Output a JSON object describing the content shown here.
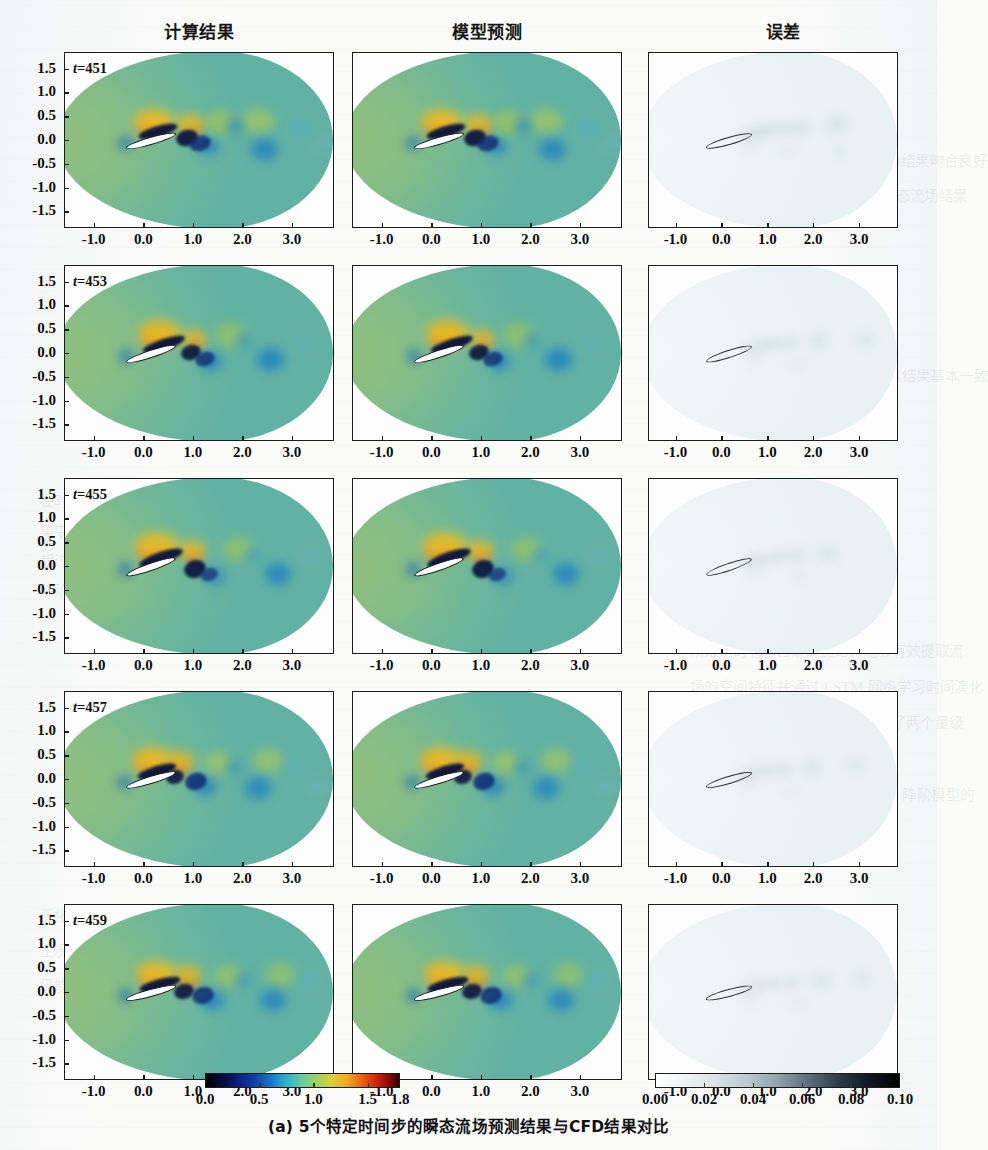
{
  "figure": {
    "caption": "(a) 5个特定时间步的瞬态流场预测结果与CFD结果对比",
    "columns": [
      {
        "key": "cfd",
        "label": "计算结果"
      },
      {
        "key": "model",
        "label": "模型预测"
      },
      {
        "key": "error",
        "label": "误差"
      }
    ],
    "rows": [
      {
        "time_label": "t=451",
        "t": 451
      },
      {
        "time_label": "t=453",
        "t": 453
      },
      {
        "time_label": "t=455",
        "t": 455
      },
      {
        "time_label": "t=457",
        "t": 457
      },
      {
        "time_label": "t=459",
        "t": 459
      }
    ]
  },
  "axes": {
    "x_ticks": [
      "-1.0",
      "0.0",
      "1.0",
      "2.0",
      "3.0"
    ],
    "x_values": [
      -1.0,
      0.0,
      1.0,
      2.0,
      3.0
    ],
    "y_ticks": [
      "1.5",
      "1.0",
      "0.5",
      "0.0",
      "-0.5",
      "-1.0",
      "-1.5"
    ],
    "y_values": [
      1.5,
      1.0,
      0.5,
      0.0,
      -0.5,
      -1.0,
      -1.5
    ],
    "xlim": [
      -1.6,
      3.85
    ],
    "ylim": [
      -1.85,
      1.85
    ]
  },
  "colorbars": {
    "field": {
      "ticks": [
        "0.0",
        "0.5",
        "1.0",
        "1.5",
        "1.8"
      ],
      "values": [
        0.0,
        0.5,
        1.0,
        1.5,
        1.8
      ],
      "range": [
        0.0,
        1.8
      ],
      "colors": [
        "#000000",
        "#0a1a6e",
        "#1878c8",
        "#2fb3cf",
        "#9ad25f",
        "#d7d13a",
        "#f2aa20",
        "#d0260d",
        "#2a0202"
      ]
    },
    "error": {
      "ticks": [
        "0.00",
        "0.02",
        "0.04",
        "0.06",
        "0.08",
        "0.10"
      ],
      "values": [
        0.0,
        0.02,
        0.04,
        0.06,
        0.08,
        0.1
      ],
      "range": [
        0.0,
        0.1
      ],
      "colors": [
        "#ffffff",
        "#b9c8cf",
        "#5d7180",
        "#141b28",
        "#000000"
      ]
    }
  },
  "chart_data": {
    "type": "heatmap",
    "title": "(a) 5个特定时间步的瞬态流场预测结果与CFD结果对比",
    "xlabel": "",
    "ylabel": "",
    "grid": false,
    "legend_position": "bottom",
    "panel_grid": {
      "rows": 5,
      "cols": 3
    },
    "column_labels": [
      "计算结果",
      "模型预测",
      "误差"
    ],
    "row_labels": [
      "t=451",
      "t=453",
      "t=455",
      "t=457",
      "t=459"
    ],
    "xlim": [
      -1.6,
      3.85
    ],
    "ylim": [
      -1.85,
      1.85
    ],
    "x_ticks": [
      -1.0,
      0.0,
      1.0,
      2.0,
      3.0
    ],
    "y_ticks": [
      1.5,
      1.0,
      0.5,
      0.0,
      -0.5,
      -1.0,
      -1.5
    ],
    "field_variable": "velocity magnitude",
    "field_clim": [
      0.0,
      1.8
    ],
    "error_variable": "absolute error",
    "error_clim": [
      0.0,
      0.1
    ],
    "geometry": "pitching airfoil, chord ~1.0 at x in [-0.4, 0.6], angle of attack varies per time step"
  },
  "ghost_text": {
    "lines": [
      "的结果与 CFD 计算的瞬态流场结果吻合良好",
      "ST-SOGS 的预测 5个时间步的瞬态流场结果",
      "网络模型的预测结果与数值模拟结果基本一致",
      "在时间方向上的演化趋势捕捉准确误差主要",
      "集中于翼型尾缘的涡脱落区域误差最大值不",
      "超过 0.1该模型的泛化能力较强",
      "降阶模型在流场重构方面表现出较好的精度",
      "所采用的卷积自编码器结构能够有效提取流",
      "场的空间特征并通过 LSTM 网络学习时间演化",
      "规律计算效率相比全阶模型提升了两个量级",
      "4.4 模型泛化性验证",
      "为进一步验证本文所提 ST-SOGS 降阶模型的",
      "泛化性能分别在不同雷诺数和不同来流攻角",
      "工况下开展测试结果表明模型在训练区间外",
      "仍能保持较高的预测精度"
    ]
  }
}
